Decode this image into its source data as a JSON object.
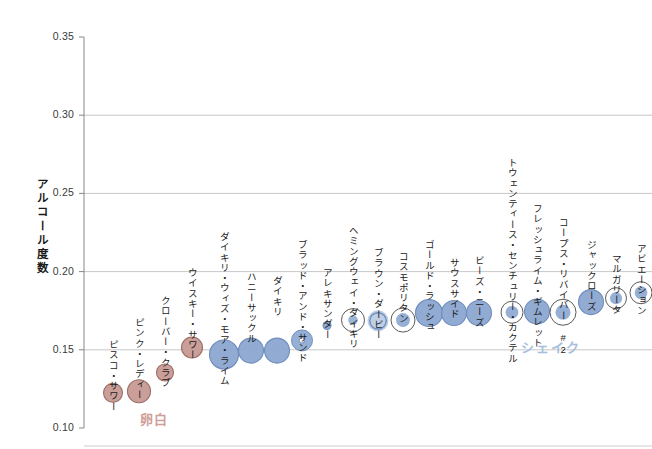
{
  "chart_data": {
    "type": "scatter",
    "title": "",
    "xlabel": "",
    "ylabel": "アルコール度数",
    "ylim": [
      0.1,
      0.35
    ],
    "ytick_values": [
      0.35,
      0.3,
      0.25,
      0.2,
      0.15,
      0.1
    ],
    "ytick_labels": [
      "0.35",
      "0.30",
      "0.25",
      "0.20",
      "0.15",
      "0.10"
    ],
    "grid": "horizontal",
    "legend_position": "inline-annotations",
    "annotations": [
      {
        "text": "卵白",
        "color": "#cf9e98",
        "x": 140,
        "y": 409
      },
      {
        "text": "シェイク",
        "color": "#a7bede",
        "x": 521,
        "y": 337
      }
    ],
    "colors": {
      "egg_white_fill": "#c89a93",
      "egg_white_stroke": "#9c6d66",
      "shake_fill": "#8ba7d0",
      "shake_stroke": "#6f8dbd",
      "ring_stroke": "#5a5a5a",
      "grid": "#b9b9b9",
      "axis": "#888888"
    },
    "points": [
      {
        "label": "ピスコ・サワー",
        "x": 113,
        "y": 0.1225,
        "size": 9.5,
        "group": "egg-white",
        "style": "solid",
        "label_y": 340
      },
      {
        "label": "ピンク・レディー",
        "x": 139,
        "y": 0.1235,
        "size": 11.5,
        "group": "egg-white",
        "style": "solid",
        "label_y": 318
      },
      {
        "label": "クローバー・クラブ",
        "x": 165,
        "y": 0.1355,
        "size": 8.5,
        "group": "egg-white",
        "style": "solid",
        "label_y": 296
      },
      {
        "label": "ウイスキー・サワー",
        "x": 192,
        "y": 0.1515,
        "size": 10.5,
        "group": "egg-white",
        "style": "solid",
        "label_y": 268
      },
      {
        "label": "ダイキリ・ウィズ・モア・ライム",
        "x": 224,
        "y": 0.147,
        "size": 14.5,
        "group": "shake",
        "style": "solid",
        "label_y": 232
      },
      {
        "label": "ハニーサックル",
        "x": 251,
        "y": 0.1495,
        "size": 12.5,
        "group": "shake",
        "style": "solid",
        "label_y": 272
      },
      {
        "label": "ダイキリ",
        "x": 277,
        "y": 0.1495,
        "size": 12.5,
        "group": "shake",
        "style": "solid",
        "label_y": 276
      },
      {
        "label": "ブラッド・アンド・サンド",
        "x": 302,
        "y": 0.156,
        "size": 10.5,
        "group": "shake",
        "style": "donut",
        "label_y": 240
      },
      {
        "label": "アレキサンダー",
        "x": 327,
        "y": 0.1655,
        "size": 4.0,
        "group": "shake",
        "style": "solid",
        "label_y": 268
      },
      {
        "label": "ヘミングウェイ・ダイキリ",
        "x": 353,
        "y": 0.169,
        "size": 11.5,
        "group": "shake",
        "style": "ring-small",
        "label_y": 226
      },
      {
        "label": "ブラウン・ダービー",
        "x": 378,
        "y": 0.1685,
        "size": 10.5,
        "group": "shake",
        "style": "ring-filled",
        "label_y": 248
      },
      {
        "label": "コスモポリタン",
        "x": 403,
        "y": 0.169,
        "size": 12.0,
        "group": "shake",
        "style": "ring-mid",
        "label_y": 252
      },
      {
        "label": "ゴールド・ラッシュ",
        "x": 429,
        "y": 0.1735,
        "size": 13.5,
        "group": "shake",
        "style": "solid",
        "label_y": 240
      },
      {
        "label": "サウスサイド",
        "x": 454,
        "y": 0.1735,
        "size": 12.5,
        "group": "shake",
        "style": "solid",
        "label_y": 258
      },
      {
        "label": "ビーズ・ニーズ",
        "x": 479,
        "y": 0.1735,
        "size": 12.5,
        "group": "shake",
        "style": "solid",
        "label_y": 256
      },
      {
        "label": "トウェンティース・センチュリー・カクテル",
        "x": 512,
        "y": 0.174,
        "size": 11.0,
        "group": "shake",
        "style": "ring-mid",
        "label_y": 158
      },
      {
        "label": "フレッシュライム・ギムレット",
        "x": 537,
        "y": 0.1745,
        "size": 12.5,
        "group": "shake",
        "style": "solid",
        "label_y": 204
      },
      {
        "label": "コープス・リバイバー #2",
        "x": 563,
        "y": 0.174,
        "size": 13.0,
        "group": "shake",
        "style": "ring-mid",
        "label_y": 218
      },
      {
        "label": "ジャックローズ",
        "x": 591,
        "y": 0.1805,
        "size": 12.5,
        "group": "shake",
        "style": "solid",
        "label_y": 240
      },
      {
        "label": "マルガリータ",
        "x": 616,
        "y": 0.183,
        "size": 10.5,
        "group": "shake",
        "style": "ring-mid",
        "label_y": 254
      },
      {
        "label": "アビエーション",
        "x": 641,
        "y": 0.1865,
        "size": 11.0,
        "group": "shake",
        "style": "ring-mid",
        "label_y": 244
      }
    ]
  }
}
